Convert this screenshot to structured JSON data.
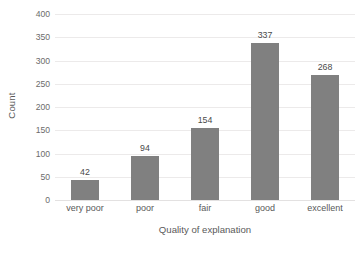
{
  "chart_data": {
    "type": "bar",
    "title": "",
    "subtitle": "",
    "categories": [
      "very poor",
      "poor",
      "fair",
      "good",
      "excellent"
    ],
    "values": [
      42,
      94,
      154,
      337,
      268
    ],
    "data_labels": [
      "42",
      "94",
      "154",
      "337",
      "268"
    ],
    "xlabel": "Quality of explanation",
    "ylabel": "Count",
    "ylim": [
      0,
      400
    ],
    "ytick_step": 50,
    "ytick_labels": [
      "400",
      "350",
      "300",
      "250",
      "200",
      "150",
      "100",
      "50",
      "0"
    ],
    "ytick_values": [
      400,
      350,
      300,
      250,
      200,
      150,
      100,
      50,
      0
    ],
    "grid": "horizontal",
    "legend": "none",
    "bar_color": "#808080",
    "gridline_color": "#eceaea",
    "text_color": "#595959",
    "background_color": "#ffffff"
  }
}
